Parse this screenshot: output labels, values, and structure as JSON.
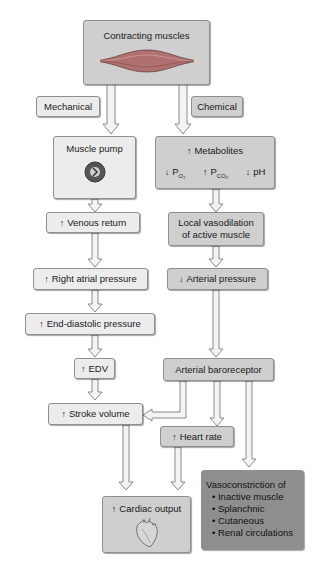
{
  "nodes": {
    "contracting_muscles": {
      "label": "Contracting muscles"
    },
    "mechanical": {
      "label": "Mechanical"
    },
    "chemical": {
      "label": "Chemical"
    },
    "muscle_pump": {
      "label": "Muscle pump"
    },
    "metabolites": {
      "arrow": "↑",
      "label": "Metabolites",
      "po2": {
        "arrow": "↓",
        "label": "P",
        "sub": "O₂"
      },
      "pco2": {
        "arrow": "↑",
        "label": "P",
        "sub": "CO₂"
      },
      "ph": {
        "arrow": "↓",
        "label": "pH"
      }
    },
    "venous_return": {
      "arrow": "↑",
      "label": "Venous return"
    },
    "local_vasodilation": {
      "line1": "Local vasodilation",
      "line2": "of active muscle"
    },
    "right_atrial_pressure": {
      "arrow": "↑",
      "label": "Right atrial pressure"
    },
    "arterial_pressure": {
      "arrow": "↓",
      "label": "Arterial pressure"
    },
    "end_diastolic_pressure": {
      "arrow": "↑",
      "label": "End-diastolic pressure"
    },
    "edv": {
      "arrow": "↑",
      "label": "EDV"
    },
    "arterial_baroreceptor": {
      "label": "Arterial baroreceptor"
    },
    "stroke_volume": {
      "arrow": "↑",
      "label": "Stroke volume"
    },
    "heart_rate": {
      "arrow": "↑",
      "label": "Heart rate"
    },
    "cardiac_output": {
      "arrow": "↑",
      "label": "Cardiac output"
    },
    "vasoconstriction": {
      "title": "Vasoconstriction of",
      "items": [
        "Inactive muscle",
        "Splanchnic",
        "Cutaneous",
        "Renal circulations"
      ]
    }
  },
  "colors": {
    "light_box": "#ececec",
    "mid_box": "#cfcfcf",
    "dark_box": "#8e8e8e",
    "arrow_fill": "#f4f4f4",
    "arrow_stroke": "#8a8a8a"
  }
}
